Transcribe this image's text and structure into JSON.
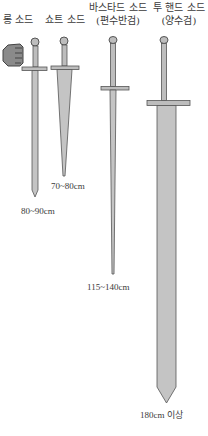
{
  "swords": [
    {
      "name": "롱 소드",
      "subtitle": "",
      "length": "80~90cm"
    },
    {
      "name": "쇼트 소드",
      "subtitle": "",
      "length": "70~80cm"
    },
    {
      "name": "바스타드 소드",
      "subtitle": "(편수반검)",
      "length": "115~140cm"
    },
    {
      "name": "투 핸드 소드",
      "subtitle": "(양수검)",
      "length": "180cm 이상"
    }
  ],
  "colors": {
    "blade_fill": "#bdbdbd",
    "outline": "#555555",
    "text": "#3a3a3a"
  },
  "icons": {
    "fist": "fist-icon"
  }
}
